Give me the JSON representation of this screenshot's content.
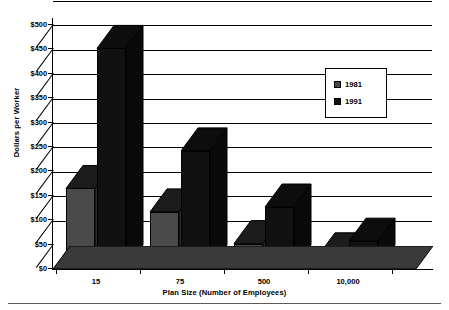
{
  "chart_data": {
    "type": "bar",
    "title": "",
    "xlabel": "Plan Size (Number of Employees)",
    "ylabel": "Dollars per Worker",
    "categories": [
      "15",
      "75",
      "500",
      "10,000"
    ],
    "series": [
      {
        "name": "1981",
        "values": [
          163,
          115,
          50,
          25
        ],
        "color": "#4a4a4a"
      },
      {
        "name": "1991",
        "values": [
          450,
          240,
          125,
          55
        ],
        "color": "#111111"
      }
    ],
    "ylim": [
      0,
      500
    ],
    "yticks": [
      0,
      50,
      100,
      150,
      200,
      250,
      300,
      350,
      400,
      450,
      500
    ],
    "ytick_labels": [
      "$0",
      "$50",
      "$100",
      "$150",
      "$200",
      "$250",
      "$300",
      "$350",
      "$400",
      "$450",
      "$500"
    ],
    "grid": true,
    "legend_position": "upper right",
    "legend_entries": [
      "1981",
      "1991"
    ],
    "style": "3d-column"
  }
}
